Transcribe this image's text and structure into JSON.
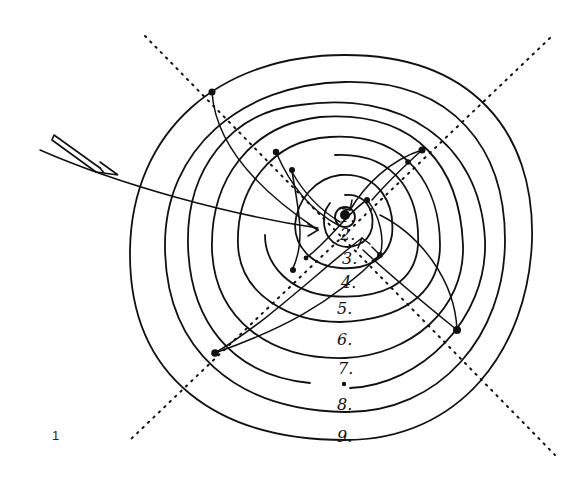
{
  "figure": {
    "number": "1",
    "center": [
      345,
      215
    ],
    "stroke_color": "#111111",
    "background": "#ffffff"
  },
  "ring_labels": [
    {
      "text": "1.",
      "x": 340,
      "y": 222
    },
    {
      "text": "2.",
      "x": 340,
      "y": 240
    },
    {
      "text": "3.",
      "x": 342,
      "y": 264
    },
    {
      "text": "4.",
      "x": 341,
      "y": 288
    },
    {
      "text": "5.",
      "x": 337,
      "y": 314
    },
    {
      "text": "6.",
      "x": 337,
      "y": 345
    },
    {
      "text": "7.",
      "x": 338,
      "y": 374
    },
    {
      "text": "8.",
      "x": 337,
      "y": 410
    },
    {
      "text": "9.",
      "x": 337,
      "y": 442
    }
  ],
  "incoming_arrow": {
    "label": "incoming-direction-arrow"
  }
}
